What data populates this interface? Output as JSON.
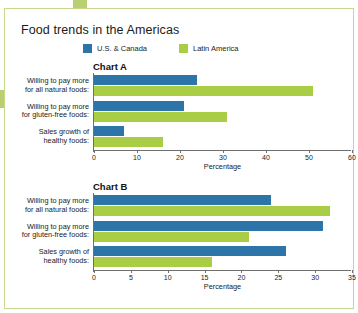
{
  "title": "Food trends in the Americas",
  "legend": [
    {
      "label": "U.S. & Canada",
      "color": "#2d74a8",
      "icon": "legend-swatch-blue"
    },
    {
      "label": "Latin America",
      "color": "#a9ce45",
      "icon": "legend-swatch-green"
    }
  ],
  "colors": {
    "blue": "#2d74a8",
    "green": "#a9ce45",
    "frame": "#c5d98a",
    "tab": "#b9cf72",
    "axis": "#6f6f6f"
  },
  "chart_data": [
    {
      "type": "bar",
      "title": "Chart A",
      "orientation": "horizontal",
      "categories": [
        "Willing to pay more for all natural foods:",
        "Willing to pay more for gluten-free foods:",
        "Sales growth of healthy foods:"
      ],
      "category_lines": [
        [
          "Willing to pay more",
          "for all natural foods:"
        ],
        [
          "Willing to pay more",
          "for gluten-free foods:"
        ],
        [
          "Sales growth of",
          "healthy foods:"
        ]
      ],
      "series": [
        {
          "name": "U.S. & Canada",
          "color": "#2d74a8",
          "values": [
            24,
            21,
            7
          ]
        },
        {
          "name": "Latin America",
          "color": "#a9ce45",
          "values": [
            51,
            31,
            16
          ]
        }
      ],
      "xlabel": "Percentage",
      "ylabel": "",
      "xlim": [
        0,
        60
      ],
      "xticks": [
        0,
        10,
        20,
        30,
        40,
        50,
        60
      ],
      "grid": false,
      "legend_position": "top"
    },
    {
      "type": "bar",
      "title": "Chart B",
      "orientation": "horizontal",
      "categories": [
        "Willing to pay more for all natural foods:",
        "Willing to pay more for gluten-free foods:",
        "Sales growth of healthy foods:"
      ],
      "category_lines": [
        [
          "Willing to pay more",
          "for all natural foods:"
        ],
        [
          "Willing to pay more",
          "for gluten-free foods:"
        ],
        [
          "Sales growth of",
          "healthy foods:"
        ]
      ],
      "series": [
        {
          "name": "U.S. & Canada",
          "color": "#2d74a8",
          "values": [
            24,
            31,
            26
          ]
        },
        {
          "name": "Latin America",
          "color": "#a9ce45",
          "values": [
            32,
            21,
            16
          ]
        }
      ],
      "xlabel": "Percentage",
      "ylabel": "",
      "xlim": [
        0,
        35
      ],
      "xticks": [
        0,
        5,
        10,
        15,
        20,
        25,
        30,
        35
      ],
      "grid": false,
      "legend_position": "top"
    }
  ]
}
